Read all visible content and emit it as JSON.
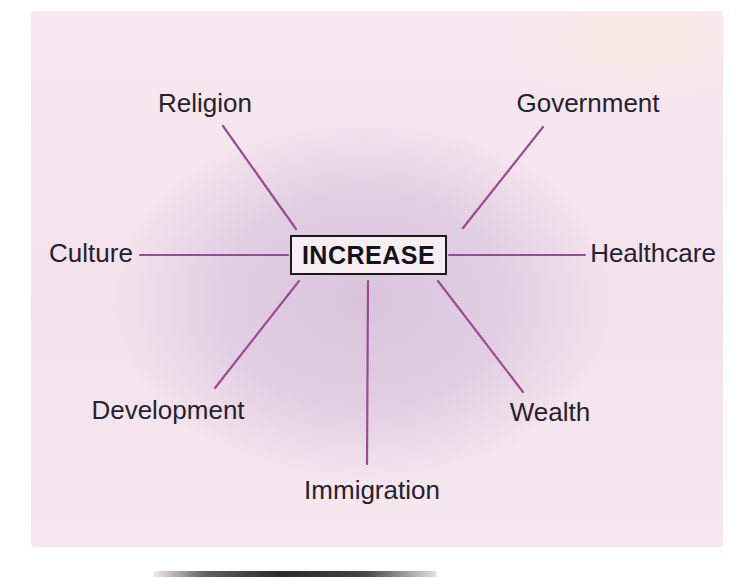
{
  "diagram": {
    "center": {
      "label": "INCREASE"
    },
    "nodes": [
      {
        "id": "religion",
        "label": "Religion"
      },
      {
        "id": "government",
        "label": "Government"
      },
      {
        "id": "culture",
        "label": "Culture"
      },
      {
        "id": "healthcare",
        "label": "Healthcare"
      },
      {
        "id": "development",
        "label": "Development"
      },
      {
        "id": "wealth",
        "label": "Wealth"
      },
      {
        "id": "immigration",
        "label": "Immigration"
      }
    ],
    "colors": {
      "connector": "#994c93",
      "panel_center": "#d9c4dc",
      "panel_edge": "#f7e9ef",
      "box_background": "#f7eef3",
      "box_border": "#1a1a1a",
      "text": "#262130"
    }
  }
}
